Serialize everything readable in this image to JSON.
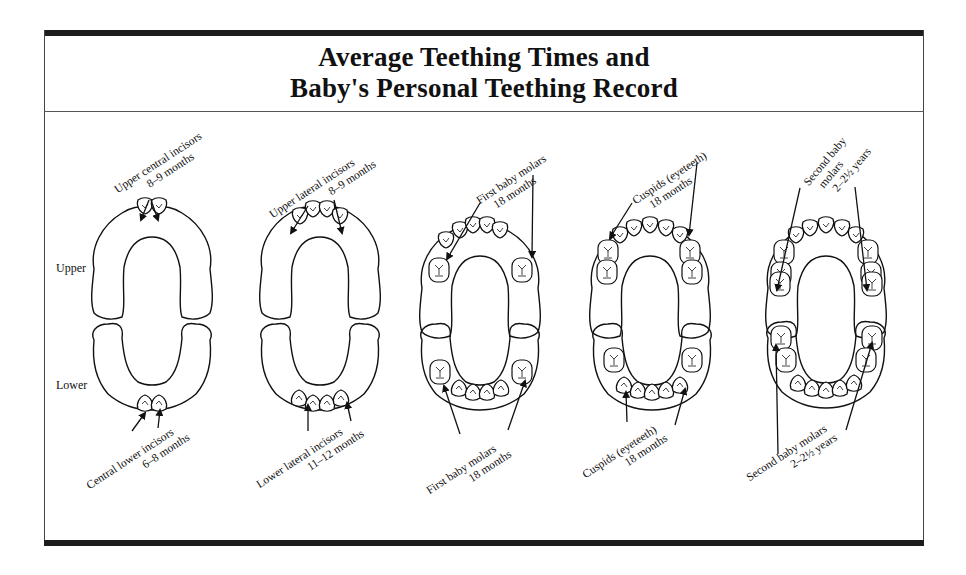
{
  "title": {
    "line1": "Average Teething Times and",
    "line2": "Baby's Personal Teething Record"
  },
  "row_labels": {
    "upper": "Upper",
    "lower": "Lower"
  },
  "stages": [
    {
      "id": "central-incisors",
      "upper_label": {
        "line1": "Upper central incisors",
        "line2": "8–9 months"
      },
      "lower_label": {
        "line1": "Central lower incisors",
        "line2": "6–8 months"
      }
    },
    {
      "id": "lateral-incisors",
      "upper_label": {
        "line1": "Upper lateral incisors",
        "line2": "8–9 months"
      },
      "lower_label": {
        "line1": "Lower lateral incisors",
        "line2": "11–12 months"
      }
    },
    {
      "id": "first-molars",
      "upper_label": {
        "line1": "First baby molars",
        "line2": "18 months"
      },
      "lower_label": {
        "line1": "First baby molars",
        "line2": "18 months"
      }
    },
    {
      "id": "cuspids",
      "upper_label": {
        "line1": "Cuspids (eyeteeth)",
        "line2": "18 months"
      },
      "lower_label": {
        "line1": "Cuspids (eyeteeth)",
        "line2": "18 months"
      }
    },
    {
      "id": "second-molars",
      "upper_label": {
        "line1": "Second baby",
        "line2": "molars",
        "line3": "2–2½ years"
      },
      "lower_label": {
        "line1": "Second baby molars",
        "line2": "2–2½ years"
      }
    }
  ],
  "colors": {
    "ink": "#111111",
    "bar": "#1c1c1c",
    "background": "#ffffff"
  }
}
